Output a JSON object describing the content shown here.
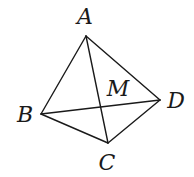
{
  "diagram": {
    "type": "tetrahedron",
    "vertices": {
      "A": {
        "x": 86,
        "y": 36,
        "label": "A",
        "label_x": 85,
        "label_y": 24
      },
      "B": {
        "x": 41,
        "y": 114,
        "label": "B",
        "label_x": 25,
        "label_y": 122
      },
      "C": {
        "x": 108,
        "y": 143,
        "label": "C",
        "label_x": 107,
        "label_y": 170
      },
      "D": {
        "x": 160,
        "y": 100,
        "label": "D",
        "label_x": 176,
        "label_y": 108
      }
    },
    "point_M": {
      "label": "M",
      "label_x": 118,
      "label_y": 96
    },
    "edges": [
      [
        "A",
        "B"
      ],
      [
        "A",
        "D"
      ],
      [
        "A",
        "C"
      ],
      [
        "B",
        "C"
      ],
      [
        "C",
        "D"
      ],
      [
        "B",
        "D"
      ]
    ],
    "stroke_color": "#1a1a1a"
  }
}
